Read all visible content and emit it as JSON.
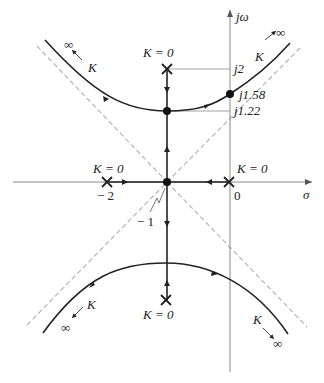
{
  "diagram": {
    "type": "root-locus",
    "axes": {
      "real_label": "σ",
      "imag_label": "jω",
      "origin_label": "0"
    },
    "poles": [
      {
        "location": "-2",
        "label": "K = 0",
        "tick": "− 2"
      },
      {
        "location": "0",
        "label": "K = 0",
        "tick": "0"
      },
      {
        "location": "-1+j2",
        "label": "K = 0",
        "tick": "j2"
      },
      {
        "location": "-1-j2",
        "label": "K = 0"
      }
    ],
    "points": [
      {
        "label": "j1.58",
        "description": "imaginary-axis crossing"
      },
      {
        "label": "j1.22",
        "description": "breakaway point"
      },
      {
        "label": "− 1",
        "description": "breakin point / asymptote centroid"
      }
    ],
    "branch_labels": {
      "gain": "K",
      "infinity": "∞"
    },
    "colors": {
      "locus": "#222222",
      "axis": "#888888",
      "asymptote": "#b0b0b0",
      "guide": "#999999"
    }
  }
}
